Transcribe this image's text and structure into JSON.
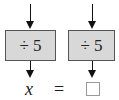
{
  "diagram": {
    "boxes": [
      {
        "label": "÷ 5"
      },
      {
        "label": "÷ 5"
      }
    ],
    "bottom": {
      "left": "x",
      "equals": "=",
      "right": ""
    },
    "colors": {
      "box_fill": "#d8d8d8",
      "box_border": "#555555",
      "arrow": "#111111"
    }
  }
}
